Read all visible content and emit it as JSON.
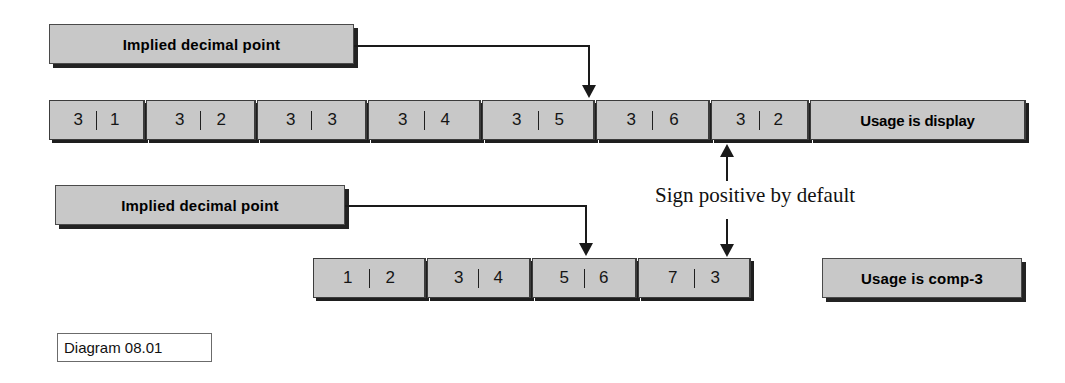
{
  "diagram": {
    "caption": "Diagram 08.01",
    "annotation_sign": "Sign positive by default",
    "callouts": {
      "implied_decimal_point_top": "Implied decimal point",
      "implied_decimal_point_bottom": "Implied decimal point"
    },
    "display_row": {
      "usage_label": "Usage is display",
      "cells": [
        {
          "left": "3",
          "right": "1"
        },
        {
          "left": "3",
          "right": "2"
        },
        {
          "left": "3",
          "right": "3"
        },
        {
          "left": "3",
          "right": "4"
        },
        {
          "left": "3",
          "right": "5"
        },
        {
          "left": "3",
          "right": "6"
        },
        {
          "left": "3",
          "right": "2"
        }
      ]
    },
    "comp3_row": {
      "usage_label": "Usage is comp-3",
      "cells": [
        {
          "left": "1",
          "right": "2"
        },
        {
          "left": "3",
          "right": "4"
        },
        {
          "left": "5",
          "right": "6"
        },
        {
          "left": "7",
          "right": "3"
        }
      ]
    }
  }
}
